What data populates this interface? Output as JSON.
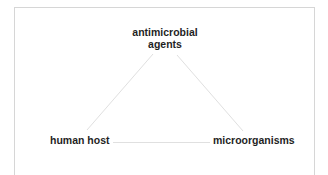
{
  "diagram": {
    "type": "triangle",
    "nodes": [
      {
        "id": "top",
        "label_line1": "antimicrobial",
        "label_line2": "agents"
      },
      {
        "id": "left",
        "label": "human host"
      },
      {
        "id": "right",
        "label": "microorganisms"
      }
    ],
    "edges": [
      {
        "from": "top",
        "to": "left"
      },
      {
        "from": "top",
        "to": "right"
      },
      {
        "from": "left",
        "to": "right"
      }
    ],
    "colors": {
      "edge": "#e0e0e0",
      "border": "#d6d6d6",
      "text": "#1f1f1f"
    }
  }
}
